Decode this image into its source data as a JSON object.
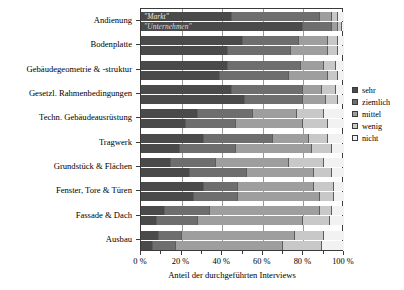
{
  "chart_data": {
    "type": "bar",
    "orientation": "horizontal",
    "stacked": true,
    "normalized_percent": true,
    "title": "",
    "xlabel": "Anteil der durchgeführten Interviews",
    "ylabel": "",
    "xlim": [
      0,
      100
    ],
    "xticks": [
      0,
      20,
      40,
      60,
      80,
      100
    ],
    "xticklabels": [
      "0 %",
      "20 %",
      "40 %",
      "60 %",
      "80 %",
      "100 %"
    ],
    "grid": true,
    "legend_position": "right",
    "legend": [
      "sehr",
      "ziemlich",
      "mittel",
      "wenig",
      "nicht"
    ],
    "segment_colors": [
      "#4a4a4a",
      "#6e6e6e",
      "#9e9e9e",
      "#c8c8c8",
      "#f2f2f2"
    ],
    "annotations": [
      "\"Markt\"",
      "\"Unternehmen\""
    ],
    "categories": [
      "Andienung",
      "Bodenplatte",
      "Gebäudegeometrie & -struktur",
      "Gesetzl. Rahmenbedingungen",
      "Techn. Gebäudeausrüstung",
      "Tragwerk",
      "Grundstück & Flächen",
      "Fenster, Tore & Türen",
      "Fassade & Dach",
      "Ausbau"
    ],
    "groups": [
      {
        "name": "Markt",
        "series": [
          {
            "name": "sehr",
            "values": [
              45,
              50,
              43,
              45,
              28,
              31,
              15,
              31,
              12,
              9
            ]
          },
          {
            "name": "ziemlich",
            "values": [
              43,
              28,
              36,
              35,
              27,
              34,
              22,
              17,
              22,
              11
            ]
          },
          {
            "name": "mittel",
            "values": [
              6,
              14,
              11,
              9,
              22,
              18,
              36,
              37,
              54,
              56
            ]
          },
          {
            "name": "wenig",
            "values": [
              3,
              5,
              6,
              7,
              13,
              9,
              17,
              10,
              6,
              14
            ]
          },
          {
            "name": "nicht",
            "values": [
              3,
              3,
              4,
              4,
              10,
              8,
              10,
              5,
              6,
              10
            ]
          }
        ]
      },
      {
        "name": "Unternehmen",
        "series": [
          {
            "name": "sehr",
            "values": [
              80,
              43,
              39,
              51,
              22,
              19,
              24,
              26,
              8,
              6
            ]
          },
          {
            "name": "ziemlich",
            "values": [
              14,
              31,
              34,
              29,
              25,
              28,
              28,
              22,
              20,
              11
            ]
          },
          {
            "name": "mittel",
            "values": [
              3,
              18,
              19,
              11,
              33,
              37,
              33,
              40,
              52,
              53
            ]
          },
          {
            "name": "wenig",
            "values": [
              2,
              5,
              5,
              6,
              12,
              10,
              9,
              7,
              13,
              19
            ]
          },
          {
            "name": "nicht",
            "values": [
              1,
              3,
              3,
              3,
              8,
              6,
              6,
              5,
              7,
              11
            ]
          }
        ]
      }
    ]
  }
}
